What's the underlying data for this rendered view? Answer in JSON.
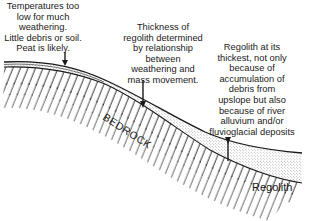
{
  "annotations": {
    "left": [
      "Temperatures too",
      "low for much",
      "weathering.",
      "Little debris or soil.",
      "Peat is likely."
    ],
    "middle": [
      "Thickness of",
      "regolith determined",
      "by relationship",
      "between",
      "weathering and",
      "mass movement."
    ],
    "right": [
      "Regolith at its",
      "thickest, not only",
      "because of",
      "accumulation of",
      "debris from",
      "upslope but also",
      "because of river",
      "alluvium and/or",
      "fluvioglacial deposits"
    ]
  },
  "labels": {
    "bedrock": "BEDROCK",
    "regolith": "Regolith"
  },
  "colors": {
    "ink": "#1a1a1a",
    "background": "#ffffff",
    "stipple": "#8a8a8a"
  }
}
